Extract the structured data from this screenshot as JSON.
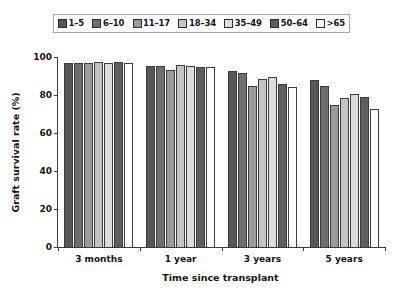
{
  "chart_data": {
    "type": "bar",
    "title": "",
    "xlabel": "Time since transplant",
    "ylabel": "Graft survival rate (%)",
    "categories": [
      "3 months",
      "1 year",
      "3 years",
      "5 years"
    ],
    "ylim": [
      0,
      100
    ],
    "yticks": [
      0,
      20,
      40,
      60,
      80,
      100
    ],
    "ytick_labels": [
      "0",
      "20",
      "40",
      "60",
      "80",
      "100"
    ],
    "grid": false,
    "legend_position": "top",
    "series": [
      {
        "name": "1–5",
        "color": "#575757",
        "values": [
          97.0,
          95.5,
          92.5,
          88.0
        ]
      },
      {
        "name": "6–10",
        "color": "#6e6e6e",
        "values": [
          97.0,
          95.5,
          91.5,
          84.5
        ]
      },
      {
        "name": "11–17",
        "color": "#9b9b9b",
        "values": [
          97.0,
          93.0,
          84.5,
          74.5
        ]
      },
      {
        "name": "18–34",
        "color": "#c4c4c4",
        "values": [
          97.5,
          96.0,
          88.5,
          78.5
        ]
      },
      {
        "name": "35–49",
        "color": "#dcdcdc",
        "values": [
          97.0,
          95.5,
          89.5,
          80.5
        ]
      },
      {
        "name": "50–64",
        "color": "#5e5e5e",
        "values": [
          97.5,
          95.0,
          86.0,
          79.0
        ]
      },
      {
        "name": ">65",
        "color": "#ffffff",
        "values": [
          97.0,
          94.5,
          84.0,
          72.5
        ]
      }
    ]
  },
  "legend": {
    "items": [
      {
        "label": "1–5",
        "color": "#575757"
      },
      {
        "label": "6–10",
        "color": "#6e6e6e"
      },
      {
        "label": "11–17",
        "color": "#9b9b9b"
      },
      {
        "label": "18–34",
        "color": "#c4c4c4"
      },
      {
        "label": "35–49",
        "color": "#dcdcdc"
      },
      {
        "label": "50–64",
        "color": "#5e5e5e"
      },
      {
        "label": ">65",
        "color": "#ffffff"
      }
    ]
  },
  "axes": {
    "y_title": "Graft survival rate (%)",
    "x_title": "Time since transplant"
  }
}
